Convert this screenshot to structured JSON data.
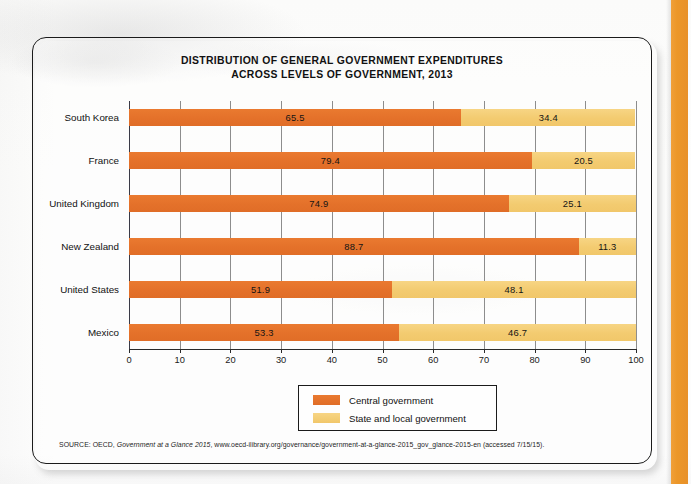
{
  "figure": {
    "title_line1": "DISTRIBUTION OF GENERAL GOVERNMENT EXPENDITURES",
    "title_line2": "ACROSS LEVELS OF GOVERNMENT, 2013",
    "source_prefix": "SOURCE: OECD, ",
    "source_italic": "Government at a Glance 2015",
    "source_suffix": ", www.oecd-ilibrary.org/governance/government-at-a-glance-2015_gov_glance-2015-en (accessed 7/15/15)."
  },
  "colors": {
    "central": "#e4712a",
    "local": "#f3cb70",
    "gridline": "#8d8d8d",
    "axis": "#2a2a2a",
    "page_edge_tab": "#ec9729"
  },
  "legend": {
    "items": [
      {
        "label": "Central government",
        "key": "central"
      },
      {
        "label": "State and local government",
        "key": "local"
      }
    ]
  },
  "chart_data": {
    "type": "bar",
    "orientation": "horizontal",
    "stacked": true,
    "title": "DISTRIBUTION OF GENERAL GOVERNMENT EXPENDITURES ACROSS LEVELS OF GOVERNMENT, 2013",
    "xlabel": "",
    "ylabel": "",
    "xlim": [
      0,
      100
    ],
    "xticks": [
      0,
      10,
      20,
      30,
      40,
      50,
      60,
      70,
      80,
      90,
      100
    ],
    "grid": true,
    "legend_position": "bottom-center",
    "categories": [
      "South Korea",
      "France",
      "United Kingdom",
      "New Zealand",
      "United States",
      "Mexico"
    ],
    "series": [
      {
        "name": "Central government",
        "values": [
          65.5,
          79.4,
          74.9,
          88.7,
          51.9,
          53.3
        ]
      },
      {
        "name": "State and local government",
        "values": [
          34.4,
          20.5,
          25.1,
          11.3,
          48.1,
          46.7
        ]
      }
    ],
    "data_labels": [
      {
        "category": "South Korea",
        "central": "65.5",
        "local": "34.4"
      },
      {
        "category": "France",
        "central": "79.4",
        "local": "20.5"
      },
      {
        "category": "United Kingdom",
        "central": "74.9",
        "local": "25.1"
      },
      {
        "category": "New Zealand",
        "central": "88.7",
        "local": "11.3"
      },
      {
        "category": "United States",
        "central": "51.9",
        "local": "48.1"
      },
      {
        "category": "Mexico",
        "central": "53.3",
        "local": "46.7"
      }
    ]
  }
}
